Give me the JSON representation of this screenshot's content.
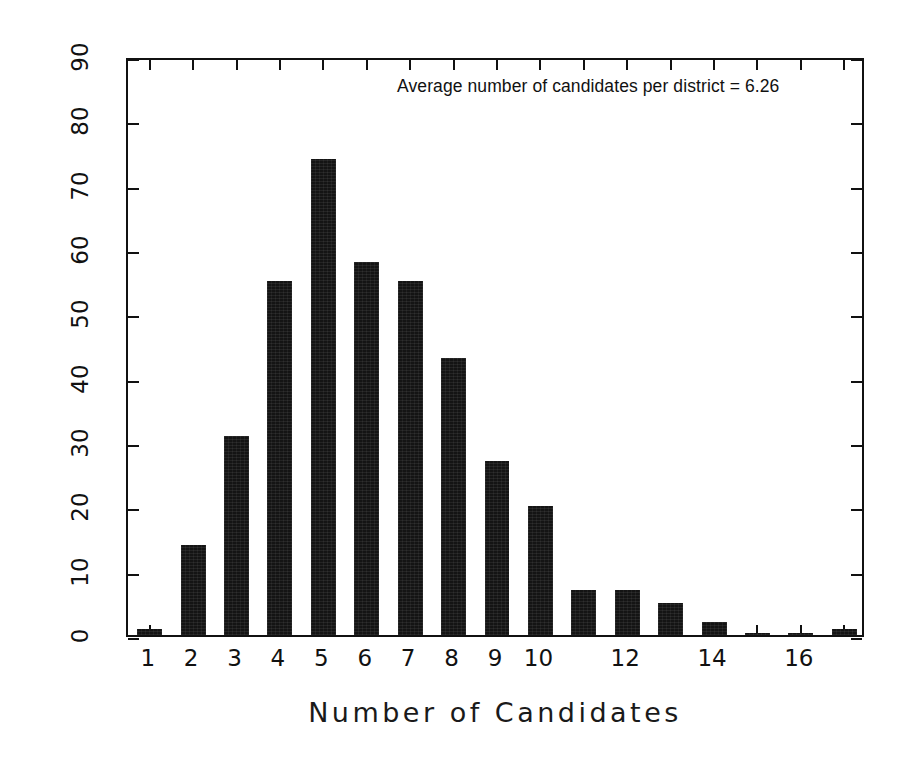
{
  "chart_data": {
    "type": "bar",
    "title": "",
    "xlabel": "Number of Candidates",
    "ylabel": "Number of Districts",
    "categories": [
      1,
      2,
      3,
      4,
      5,
      6,
      7,
      8,
      9,
      10,
      11,
      12,
      13,
      14,
      15,
      16,
      17
    ],
    "values": [
      1,
      14,
      31,
      55,
      74,
      58,
      55,
      43,
      27,
      20,
      7,
      7,
      5,
      2,
      0.3,
      0.3,
      1
    ],
    "xtick_labels": [
      "1",
      "2",
      "3",
      "4",
      "5",
      "6",
      "7",
      "8",
      "9",
      "10",
      "",
      "12",
      "",
      "14",
      "",
      "16",
      ""
    ],
    "ytick_labels": [
      "0",
      "10",
      "20",
      "30",
      "40",
      "50",
      "60",
      "70",
      "80",
      "90"
    ],
    "ytick_values": [
      0,
      10,
      20,
      30,
      40,
      50,
      60,
      70,
      80,
      90
    ],
    "ylim": [
      0,
      90
    ],
    "xlim": [
      0.5,
      17.5
    ],
    "grid": false,
    "legend": false,
    "bar_color": "#141414",
    "axis_color": "#111111",
    "annotations": [
      {
        "text": "Average number of candidates per district = 6.26",
        "x": 6.26,
        "label": "average-candidates-per-district"
      }
    ]
  },
  "figure": {
    "background_color": "#ffffff",
    "annotation_text": "Average number of candidates per district = 6.26",
    "x_axis_title": "Number of Candidates",
    "y_axis_title": "Number of Districts"
  }
}
